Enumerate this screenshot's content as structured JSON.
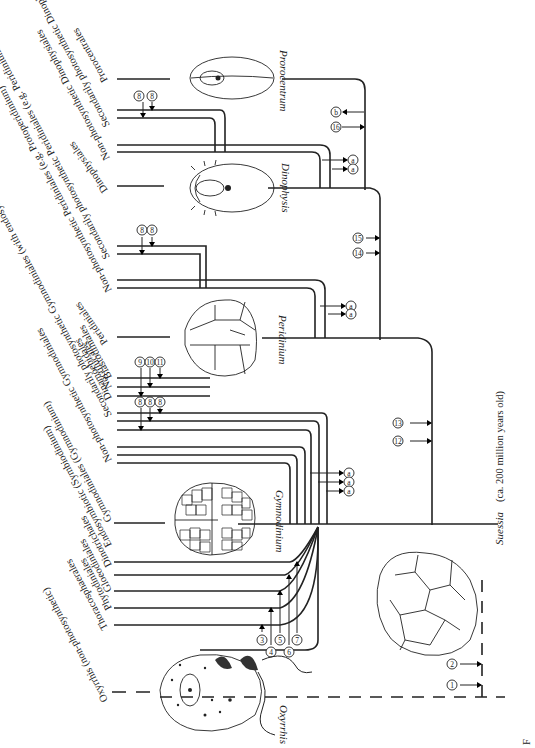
{
  "diagram": {
    "type": "phylogenetic-tree",
    "orientation": "rotated-90",
    "taxa": [
      {
        "id": "oxyrrhis",
        "label": "Oxyrrhis (non-photosynthetic)"
      },
      {
        "id": "thoracosphaerales",
        "label": "Thoracosphaerales"
      },
      {
        "id": "phytodiniales",
        "label": "Phytodiniales"
      },
      {
        "id": "gloeodiniales",
        "label": "Gloeodiniales"
      },
      {
        "id": "dinotrichales",
        "label": "Dinotrichales"
      },
      {
        "id": "endosymbiotic",
        "label": "Endosymbiotic (Symbiodinium)"
      },
      {
        "id": "gymnodiniales-photo",
        "label": "Gymnodiniales (Gymnodinium)"
      },
      {
        "id": "gymnodiniales-nonphoto",
        "label": "Non-photosynthetic Gymnodiniales"
      },
      {
        "id": "gymnodiniales-secondary",
        "label": "Secondarily photosynthetic Gymnodiniales (with endosymbionts)"
      },
      {
        "id": "dinamoebidales",
        "label": "Dinamoebidales"
      },
      {
        "id": "noctilucales",
        "label": "Noctilucales"
      },
      {
        "id": "blastodiniales",
        "label": "Blastodiniales"
      },
      {
        "id": "peridiniales",
        "label": "Peridiniales"
      },
      {
        "id": "peridiniales-nonphoto",
        "label": "Non-photosynthetic Peridiniales (e.g. Protoperidinium)"
      },
      {
        "id": "peridiniales-secondary",
        "label": "Secondarily photosynthetic Peridiniales (e.g. Peridinium balticum)"
      },
      {
        "id": "dinophysiales",
        "label": "Dinophysiales"
      },
      {
        "id": "dinophysiales-nonphoto",
        "label": "Non-photosynthetic Dinophysiales"
      },
      {
        "id": "dinophysiales-secondary",
        "label": "Secondarily photosynthetic Dinophysiales"
      },
      {
        "id": "prorocentrales",
        "label": "Prorocentrales"
      }
    ],
    "genera": [
      {
        "id": "oxyrrhis",
        "label": "Oxyrrhis"
      },
      {
        "id": "suessia",
        "label": "Suessia"
      },
      {
        "id": "gymnodinium",
        "label": "Gymnodinium"
      },
      {
        "id": "peridinium",
        "label": "Peridinium"
      },
      {
        "id": "dinophysis",
        "label": "Dinophysis"
      },
      {
        "id": "prorocentrum",
        "label": "Prorocentrum"
      }
    ],
    "suessia_caption": "(ca. 200 million years old)",
    "markers": {
      "m1": "1",
      "m2": "2",
      "m3": "3",
      "m4": "4",
      "m5": "5",
      "m6": "6",
      "m7": "7",
      "m8": "8",
      "m9": "9",
      "m10": "10",
      "m11": "11",
      "m12": "12",
      "m13": "13",
      "m14": "14",
      "m15": "15",
      "m16": "16",
      "mb": "b",
      "ma": "a"
    },
    "caption_fragment": "F"
  }
}
